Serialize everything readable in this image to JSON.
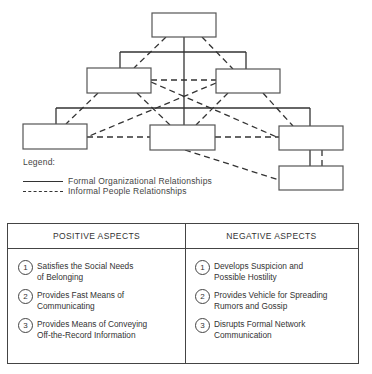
{
  "diagram": {
    "boxes": [
      {
        "id": "top",
        "x": 152,
        "y": 13,
        "w": 64,
        "h": 24
      },
      {
        "id": "mid-left",
        "x": 87,
        "y": 68,
        "w": 64,
        "h": 25
      },
      {
        "id": "mid-right",
        "x": 216,
        "y": 69,
        "w": 64,
        "h": 24
      },
      {
        "id": "bottom-left",
        "x": 23,
        "y": 124,
        "w": 64,
        "h": 25
      },
      {
        "id": "bottom-center",
        "x": 150,
        "y": 125,
        "w": 65,
        "h": 25
      },
      {
        "id": "bottom-right",
        "x": 279,
        "y": 126,
        "w": 64,
        "h": 24
      },
      {
        "id": "lowest-right",
        "x": 279,
        "y": 166,
        "w": 64,
        "h": 24
      }
    ],
    "formal_lines": [
      [
        184,
        37,
        184,
        125
      ],
      [
        120,
        52,
        246,
        52
      ],
      [
        120,
        52,
        120,
        68
      ],
      [
        246,
        52,
        246,
        69
      ],
      [
        56,
        108,
        310,
        108
      ],
      [
        56,
        108,
        56,
        124
      ],
      [
        310,
        108,
        310,
        126
      ],
      [
        310,
        150,
        310,
        166
      ]
    ],
    "informal_lines": [
      [
        166,
        37,
        134,
        68
      ],
      [
        202,
        37,
        233,
        69
      ],
      [
        151,
        80,
        216,
        80
      ],
      [
        151,
        82,
        279,
        138
      ],
      [
        216,
        83,
        87,
        137
      ],
      [
        137,
        93,
        170,
        125
      ],
      [
        228,
        93,
        196,
        125
      ],
      [
        98,
        93,
        66,
        124
      ],
      [
        263,
        93,
        293,
        126
      ],
      [
        87,
        137,
        150,
        137
      ],
      [
        215,
        137,
        279,
        137
      ],
      [
        185,
        150,
        279,
        180
      ],
      [
        322,
        150,
        322,
        166
      ]
    ]
  },
  "legend": {
    "title": "Legend:",
    "items": [
      {
        "style": "solid",
        "label": "Formal Organizational Relationships"
      },
      {
        "style": "dashed",
        "label": "Informal People Relationships"
      }
    ]
  },
  "table": {
    "positive": {
      "header": "POSITIVE ASPECTS",
      "items": [
        {
          "num": "1",
          "text": "Satisfies the Social Needs\nof Belonging"
        },
        {
          "num": "2",
          "text": "Provides Fast Means of\nCommunicating"
        },
        {
          "num": "3",
          "text": "Provides Means of Conveying\nOff-the-Record Information"
        }
      ]
    },
    "negative": {
      "header": "NEGATIVE ASPECTS",
      "items": [
        {
          "num": "1",
          "text": "Develops Suspicion and\nPossible Hostility"
        },
        {
          "num": "2",
          "text": "Provides Vehicle for Spreading\nRumors and Gossip"
        },
        {
          "num": "3",
          "text": "Disrupts Formal Network\nCommunication"
        }
      ]
    }
  },
  "colors": {
    "line": "#333333",
    "box_border": "#555555",
    "background": "#ffffff"
  }
}
